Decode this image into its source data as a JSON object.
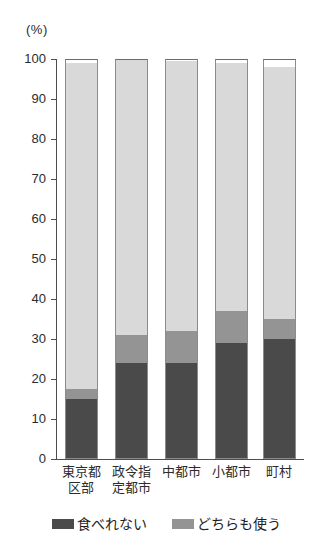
{
  "chart_data": {
    "type": "bar",
    "subtype": "stacked-bar-100",
    "title": "",
    "xlabel": "",
    "ylabel": "",
    "unit_label": "(%)",
    "ylim": [
      0,
      100
    ],
    "ytick_values": [
      0,
      10,
      20,
      30,
      40,
      50,
      60,
      70,
      80,
      90,
      100
    ],
    "ytick_labels": [
      "0",
      "10",
      "20",
      "30",
      "40",
      "50",
      "60",
      "70",
      "80",
      "90",
      "100"
    ],
    "grid": false,
    "legend_position": "bottom",
    "categories": [
      "東京都区部",
      "政令指定都市",
      "中都市",
      "小都市",
      "町村"
    ],
    "category_lines": [
      [
        "東京都",
        "区部"
      ],
      [
        "政令指",
        "定都市"
      ],
      [
        "中都市",
        ""
      ],
      [
        "小都市",
        ""
      ],
      [
        "町村",
        ""
      ]
    ],
    "series": [
      {
        "name": "食べれない",
        "legend_label": "食べれない",
        "color": "#4a4a4a",
        "values": [
          15,
          24,
          24,
          29,
          30
        ]
      },
      {
        "name": "どちらも使う",
        "legend_label": "どちらも使う",
        "color": "#949494",
        "values": [
          2.5,
          7,
          8,
          8,
          5
        ]
      },
      {
        "name": "",
        "legend_label": "",
        "color": "#d9d9d9",
        "values": [
          81.5,
          69,
          67.5,
          62,
          63
        ]
      },
      {
        "name": "",
        "legend_label": "",
        "color": "#ffffff",
        "values": [
          1,
          0,
          0.5,
          1,
          2
        ]
      }
    ]
  },
  "legend": {
    "items": [
      {
        "label": "食べれない",
        "color": "#4a4a4a"
      },
      {
        "label": "どちらも使う",
        "color": "#949494"
      }
    ]
  },
  "colors": {
    "dark": "#4a4a4a",
    "mid": "#949494",
    "light": "#d9d9d9",
    "white": "#ffffff",
    "axis": "#4d4d4d",
    "text": "#2b2b2b"
  }
}
